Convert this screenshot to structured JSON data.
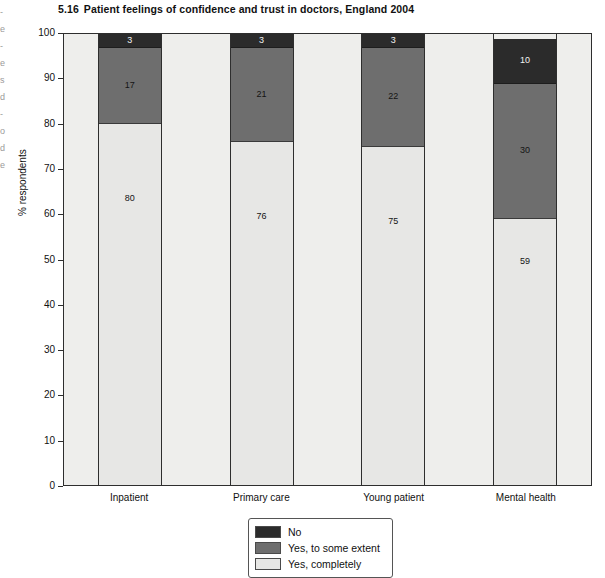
{
  "margin_text": "-\ne\n-\ne\ns\nd\n-\no\nd\ne",
  "title": {
    "number": "5.16",
    "text": "Patient feelings of confidence and trust in doctors, England 2004"
  },
  "legend": {
    "position": "bottom-center",
    "entries": [
      {
        "label": "No",
        "color": "#2b2b2b",
        "swatch": "swatch-no"
      },
      {
        "label": "Yes, to some extent",
        "color": "#6e6e6e",
        "swatch": "swatch-some"
      },
      {
        "label": "Yes, completely",
        "color": "#e7e7e5",
        "swatch": "swatch-yes"
      }
    ]
  },
  "axes": {
    "y_title": "% respondents",
    "y_ticks": [
      "100",
      "90",
      "80",
      "70",
      "60",
      "50",
      "40",
      "30",
      "20",
      "10",
      "0"
    ],
    "x_labels": [
      "Inpatient",
      "Primary care",
      "Young patient",
      "Mental health"
    ]
  },
  "chart_data": {
    "type": "bar",
    "stacked": true,
    "xlabel": "",
    "ylabel": "% respondents",
    "ylim": [
      0,
      100
    ],
    "ytick_step": 10,
    "grid": false,
    "legend_position": "bottom-center",
    "categories": [
      "Inpatient",
      "Primary care",
      "Young patient",
      "Mental health"
    ],
    "series": [
      {
        "name": "Yes, completely",
        "color": "#e7e7e5",
        "values": [
          80,
          76,
          75,
          59
        ]
      },
      {
        "name": "Yes, to some extent",
        "color": "#6e6e6e",
        "values": [
          17,
          21,
          22,
          30
        ]
      },
      {
        "name": "No",
        "color": "#2b2b2b",
        "values": [
          3,
          3,
          3,
          10
        ]
      }
    ],
    "bars": [
      {
        "category": "Inpatient",
        "segments": [
          {
            "label": "No",
            "value": 3
          },
          {
            "label": "Yes, to some extent",
            "value": 17
          },
          {
            "label": "Yes, completely",
            "value": 80
          }
        ]
      },
      {
        "category": "Primary care",
        "segments": [
          {
            "label": "No",
            "value": 3
          },
          {
            "label": "Yes, to some extent",
            "value": 21
          },
          {
            "label": "Yes, completely",
            "value": 76
          }
        ]
      },
      {
        "category": "Young patient",
        "segments": [
          {
            "label": "No",
            "value": 3
          },
          {
            "label": "Yes, to some extent",
            "value": 22
          },
          {
            "label": "Yes, completely",
            "value": 75
          }
        ]
      },
      {
        "category": "Mental health",
        "segments": [
          {
            "label": "No",
            "value": 10
          },
          {
            "label": "Yes, to some extent",
            "value": 30
          },
          {
            "label": "Yes, completely",
            "value": 59
          }
        ]
      }
    ]
  }
}
